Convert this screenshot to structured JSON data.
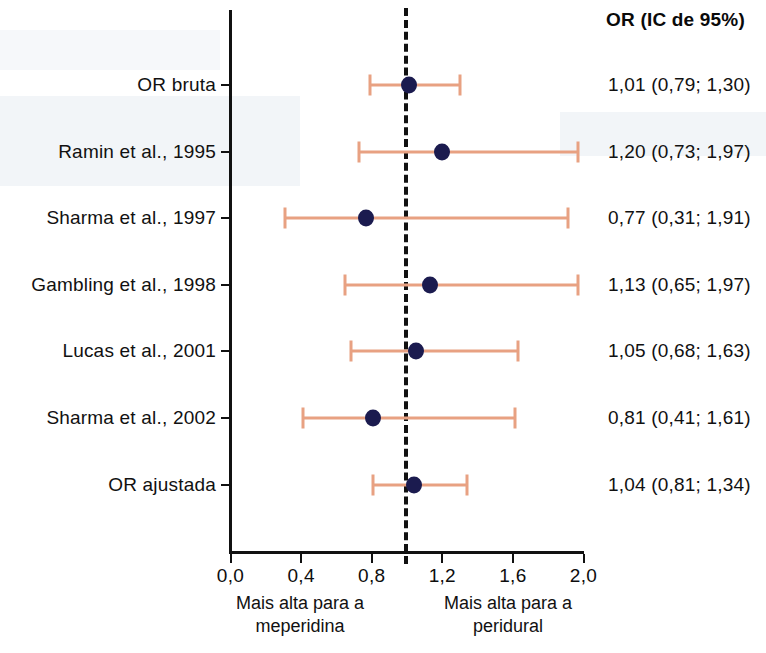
{
  "header": {
    "column_title": "OR (IC de 95%)"
  },
  "axis": {
    "ticks": [
      "0,0",
      "0,4",
      "0,8",
      "1,2",
      "1,6",
      "2,0"
    ],
    "tick_values": [
      0.0,
      0.4,
      0.8,
      1.2,
      1.6,
      2.0
    ],
    "min": 0.0,
    "max": 2.0,
    "reference_value": 1.0
  },
  "footnotes": {
    "left": "Mais alta para a\nmeperidina",
    "right": "Mais alta para a\nperidural"
  },
  "colors": {
    "marker": "#1b1b4f",
    "ci_line": "#e8a182",
    "axis": "#111111",
    "reference_line": "#111111"
  },
  "chart_data": {
    "type": "scatter",
    "title": "",
    "subtitle": "",
    "xlabel": "",
    "ylabel": "",
    "xlim": [
      0.0,
      2.0
    ],
    "grid": false,
    "legend": "none",
    "reference_line": 1.0,
    "xticks": [
      0.0,
      0.4,
      0.8,
      1.2,
      1.6,
      2.0
    ],
    "xtick_labels": [
      "0,0",
      "0,4",
      "0,8",
      "1,2",
      "1,6",
      "2,0"
    ],
    "annotations": {
      "left_direction": "Mais alta para a meperidina",
      "right_direction": "Mais alta para a peridural",
      "value_column_header": "OR (IC de 95%)"
    },
    "categories": [
      "OR bruta",
      "Ramin et al., 1995",
      "Sharma et al., 1997",
      "Gambling et al., 1998",
      "Lucas et al., 2001",
      "Sharma et al., 2002",
      "OR ajustada"
    ],
    "rows": [
      {
        "label": "OR bruta",
        "or": 1.01,
        "ci_low": 0.79,
        "ci_high": 1.3,
        "value_text": "1,01 (0,79; 1,30)"
      },
      {
        "label": "Ramin et al., 1995",
        "or": 1.2,
        "ci_low": 0.73,
        "ci_high": 1.97,
        "value_text": "1,20 (0,73; 1,97)"
      },
      {
        "label": "Sharma et al., 1997",
        "or": 0.77,
        "ci_low": 0.31,
        "ci_high": 1.91,
        "value_text": "0,77 (0,31; 1,91)"
      },
      {
        "label": "Gambling et al., 1998",
        "or": 1.13,
        "ci_low": 0.65,
        "ci_high": 1.97,
        "value_text": "1,13 (0,65; 1,97)"
      },
      {
        "label": "Lucas et al., 2001",
        "or": 1.05,
        "ci_low": 0.68,
        "ci_high": 1.63,
        "value_text": "1,05 (0,68; 1,63)"
      },
      {
        "label": "Sharma et al., 2002",
        "or": 0.81,
        "ci_low": 0.41,
        "ci_high": 1.61,
        "value_text": "0,81 (0,41; 1,61)"
      },
      {
        "label": "OR ajustada",
        "or": 1.04,
        "ci_low": 0.81,
        "ci_high": 1.34,
        "value_text": "1,04 (0,81; 1,34)"
      }
    ]
  }
}
